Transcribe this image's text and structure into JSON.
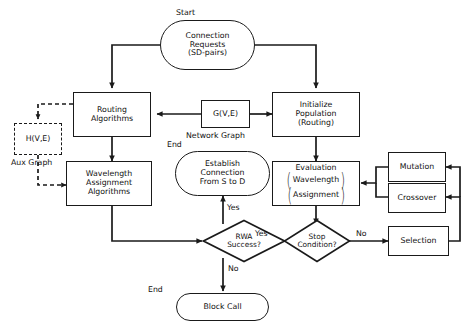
{
  "diagram": {
    "stroke_color": "#1a1a1a",
    "background": "#ffffff"
  },
  "labels": {
    "start": "Start",
    "end_establish": "End",
    "end_block": "End",
    "network_graph": "Network Graph",
    "aux_graph": "Aux Graph"
  },
  "nodes": {
    "connection_requests": {
      "line1": "Connection",
      "line2": "Requests",
      "line3": "(SD-pairs)",
      "shape": "terminator"
    },
    "routing_algorithms": {
      "line1": "Routing",
      "line2": "Algorithms",
      "shape": "process"
    },
    "wavelength_assignment": {
      "line1": "Wavelength",
      "line2": "Assignment",
      "line3": "Algorithms",
      "shape": "process"
    },
    "network_graph_node": {
      "label": "G(V,E)",
      "shape": "process"
    },
    "aux_graph_node": {
      "label": "H(V,E)",
      "shape": "process-dashed"
    },
    "initialize_population": {
      "line1": "Initialize",
      "line2": "Population",
      "line3": "(Routing)",
      "shape": "process"
    },
    "evaluation": {
      "line1": "Evaluation",
      "line2": "Wavelength",
      "line3": "Assignment",
      "shape": "process"
    },
    "mutation": {
      "label": "Mutation",
      "shape": "process"
    },
    "crossover": {
      "label": "Crossover",
      "shape": "process"
    },
    "selection": {
      "label": "Selection",
      "shape": "process"
    },
    "establish_connection": {
      "line1": "Establish",
      "line2": "Connection",
      "line3": "From S to D",
      "shape": "terminator"
    },
    "block_call": {
      "label": "Block Call",
      "shape": "terminator"
    },
    "rwa_success": {
      "line1": "RWA",
      "line2": "Success?",
      "shape": "decision"
    },
    "stop_condition": {
      "line1": "Stop",
      "line2": "Condition?",
      "shape": "decision"
    }
  },
  "edge_labels": {
    "rwa_yes": "Yes",
    "rwa_no": "No",
    "stop_yes": "Yes",
    "stop_no": "No"
  }
}
